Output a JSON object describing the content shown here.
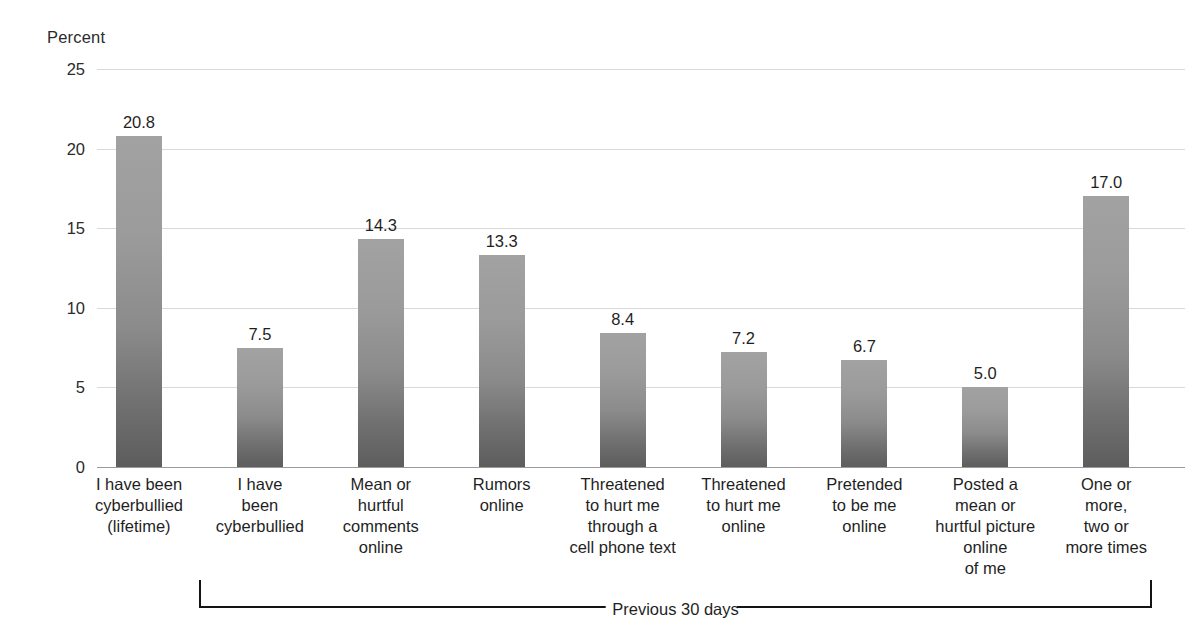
{
  "chart_data": {
    "type": "bar",
    "title": "",
    "subtitle": "",
    "xlabel": "",
    "ylabel": "Percent",
    "ylim": [
      0,
      25
    ],
    "yticks": [
      0,
      5,
      10,
      15,
      20,
      25
    ],
    "ytick_labels": [
      "0",
      "5",
      "10",
      "15",
      "20",
      "25"
    ],
    "grid": true,
    "legend": false,
    "categories": [
      "I have been cyberbullied (lifetime)",
      "I have been cyberbullied",
      "Mean or hurtful comments online",
      "Rumors online",
      "Threatened to hurt me through a cell phone text",
      "Threatened to hurt me online",
      "Pretended to be me online",
      "Posted a mean or hurtful picture online of me",
      "One or more, two or more times"
    ],
    "category_lines": [
      [
        "I have been",
        "cyberbullied",
        "(lifetime)"
      ],
      [
        "I have",
        "been",
        "cyberbullied"
      ],
      [
        "Mean or",
        "hurtful",
        "comments",
        "online"
      ],
      [
        "Rumors",
        "online"
      ],
      [
        "Threatened",
        "to hurt me",
        "through a",
        "cell phone text"
      ],
      [
        "Threatened",
        "to hurt me",
        "online"
      ],
      [
        "Pretended",
        "to be me",
        "online"
      ],
      [
        "Posted a",
        "mean or",
        "hurtful picture",
        "online",
        "of me"
      ],
      [
        "One or",
        "more,",
        "two or",
        "more times"
      ]
    ],
    "values": [
      20.8,
      7.5,
      14.3,
      13.3,
      8.4,
      7.2,
      6.7,
      5.0,
      17.0
    ],
    "value_labels": [
      "20.8",
      "7.5",
      "14.3",
      "13.3",
      "8.4",
      "7.2",
      "6.7",
      "5.0",
      "17.0"
    ],
    "bar_color_top": "#a2a2a2",
    "bar_color_bottom": "#5d5d5d",
    "gridline_color": "#d9d9d9",
    "axis_color": "#9a9a9a",
    "text_color": "#1f1f1f"
  },
  "annotations": {
    "bracket_label": "Previous 30 days",
    "bracket_start_category_index": 1,
    "bracket_end_category_index": 8
  }
}
